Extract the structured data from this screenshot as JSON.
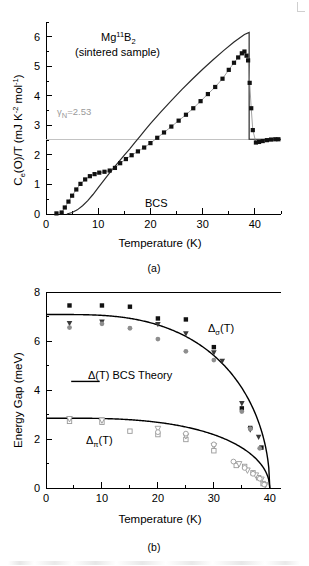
{
  "figure": {
    "panel_a_caption": "(a)",
    "panel_b_caption": "(b)"
  },
  "panel_a": {
    "sample_label_main": "Mg",
    "sample_label_sup": "11",
    "sample_label_el": "B",
    "sample_label_sub": "2",
    "sample_note": "(sintered sample)",
    "bcs_label": "BCS",
    "gamma_label_symbol": "γ",
    "gamma_label_sub": "N",
    "gamma_label_value": "=2.53",
    "ylabel_main_1": "C",
    "ylabel_sub_1": "e",
    "ylabel_main_2": "(O)/T (mJ K",
    "ylabel_sup_1": "-2",
    "ylabel_main_3": " mol",
    "ylabel_sup_2": "-1",
    "ylabel_main_4": ")",
    "xlabel": "Temperature (K)"
  },
  "panel_b": {
    "ylabel": "Energy Gap (meV)",
    "xlabel": "Temperature (K)",
    "legend_label": "Δ(T) BCS Theory",
    "sigma_label_delta": "Δ",
    "sigma_label_sub": "σ",
    "sigma_label_arg": "(T)",
    "pi_label_delta": "Δ",
    "pi_label_sub": "π",
    "pi_label_arg": "(T)"
  },
  "chart_data": [
    {
      "type": "scatter",
      "id": "panel-a",
      "title": "Mg11B2 (sintered sample)",
      "xlabel": "Temperature (K)",
      "ylabel": "Ce(O)/T (mJ K^-2 mol^-1)",
      "xlim": [
        0,
        45
      ],
      "ylim": [
        0,
        6.5
      ],
      "xticks": [
        0,
        10,
        20,
        30,
        40
      ],
      "yticks": [
        0,
        1,
        2,
        3,
        4,
        5,
        6
      ],
      "xminor_step": 5,
      "yminor_step": 0.5,
      "grid": false,
      "legend": "none",
      "annotations": [
        {
          "text": "Mg11B2",
          "x": 16.0,
          "y": 5.85
        },
        {
          "text": "(sintered sample)",
          "x": 16.0,
          "y": 5.35
        },
        {
          "text": "gamma_N=2.53",
          "x": 8.0,
          "y": 2.72
        },
        {
          "text": "BCS",
          "x": 24.0,
          "y": 0.47
        }
      ],
      "gamma_n": 2.53,
      "series": [
        {
          "name": "Ce/T measured (filled squares)",
          "marker": "filled-square",
          "x": [
            2.0,
            3.0,
            3.6,
            4.3,
            5.0,
            5.8,
            6.6,
            7.5,
            8.4,
            9.3,
            10.2,
            11.2,
            12.2,
            13.2,
            14.2,
            15.3,
            16.4,
            17.6,
            18.8,
            20.0,
            21.3,
            22.6,
            24.0,
            25.4,
            26.8,
            28.2,
            29.6,
            31.0,
            32.4,
            33.8,
            35.0,
            36.0,
            36.8,
            37.5,
            38.0,
            38.4,
            38.7,
            39.0,
            39.3,
            39.6,
            40.2,
            40.8,
            41.5,
            42.3,
            43.1,
            43.9,
            44.5
          ],
          "y": [
            0.02,
            0.05,
            0.22,
            0.42,
            0.62,
            0.83,
            1.02,
            1.17,
            1.28,
            1.35,
            1.4,
            1.43,
            1.47,
            1.56,
            1.72,
            1.86,
            1.99,
            2.12,
            2.25,
            2.4,
            2.58,
            2.76,
            2.96,
            3.16,
            3.36,
            3.58,
            3.82,
            4.06,
            4.3,
            4.58,
            4.88,
            5.12,
            5.3,
            5.44,
            5.5,
            5.36,
            5.2,
            4.44,
            3.58,
            2.84,
            2.42,
            2.44,
            2.47,
            2.5,
            2.52,
            2.53,
            2.53
          ]
        }
      ],
      "curves": [
        {
          "name": "BCS",
          "style": "solid",
          "x": [
            4.0,
            5.0,
            6.0,
            7.0,
            8.0,
            9.0,
            10.0,
            11.0,
            12.0,
            13.0,
            14.0,
            15.0,
            16.0,
            17.0,
            18.0,
            19.0,
            20.0,
            22.0,
            24.0,
            26.0,
            28.0,
            30.0,
            32.0,
            34.0,
            36.0,
            38.0,
            38.9,
            38.9,
            40.0,
            42.0,
            44.0,
            45.0
          ],
          "y": [
            0.0,
            0.05,
            0.14,
            0.28,
            0.45,
            0.66,
            0.89,
            1.12,
            1.35,
            1.57,
            1.78,
            1.99,
            2.2,
            2.42,
            2.63,
            2.85,
            3.06,
            3.46,
            3.84,
            4.21,
            4.56,
            4.9,
            5.22,
            5.53,
            5.82,
            6.08,
            6.15,
            2.53,
            2.53,
            2.53,
            2.53,
            2.53
          ]
        }
      ]
    },
    {
      "type": "scatter",
      "id": "panel-b",
      "title": "Energy gaps vs temperature",
      "xlabel": "Temperature (K)",
      "ylabel": "Energy Gap (meV)",
      "xlim": [
        0,
        42
      ],
      "ylim": [
        0,
        8
      ],
      "xticks": [
        0,
        10,
        20,
        30,
        40
      ],
      "yticks": [
        0,
        2,
        4,
        6,
        8
      ],
      "xminor_step": 5,
      "yminor_step": 1,
      "grid": false,
      "legend": "inline",
      "legend_entries": [
        "Δ(T) BCS Theory"
      ],
      "annotations": [
        {
          "text": "Delta_sigma(T)",
          "x": 29.0,
          "y": 6.55
        },
        {
          "text": "Delta_pi(T)",
          "x": 9.0,
          "y": 1.95
        },
        {
          "text": "Δ(T) BCS Theory",
          "x": 10.5,
          "y": 4.35
        }
      ],
      "series": [
        {
          "name": "sigma gap - filled squares",
          "marker": "filled-square",
          "x": [
            4.2,
            10.0,
            15.0,
            20.0,
            25.0,
            30.0,
            35.0,
            36.5,
            38.5
          ],
          "y": [
            7.45,
            7.45,
            7.4,
            6.92,
            6.88,
            5.75,
            3.25,
            2.45,
            1.65
          ]
        },
        {
          "name": "sigma gap - filled down triangles",
          "marker": "filled-triangle-down",
          "x": [
            4.2,
            10.0,
            20.0,
            25.0,
            30.0,
            31.5,
            35.0,
            36.5,
            38.0
          ],
          "y": [
            6.72,
            6.78,
            6.68,
            6.3,
            5.52,
            5.18,
            3.45,
            2.38,
            2.08
          ]
        },
        {
          "name": "sigma gap - grey circles",
          "marker": "circle-grey",
          "x": [
            4.2,
            10.0,
            15.0,
            20.0,
            25.0,
            30.0,
            35.0,
            36.5,
            38.2
          ],
          "y": [
            6.55,
            6.7,
            6.52,
            6.08,
            5.58,
            5.22,
            3.12,
            2.42,
            1.62
          ]
        },
        {
          "name": "pi gap - open squares",
          "marker": "open-square",
          "x": [
            4.2,
            10.0,
            15.0,
            20.0,
            25.0,
            30.0,
            34.0,
            35.5,
            37.0,
            38.0,
            38.8
          ],
          "y": [
            2.72,
            2.68,
            2.32,
            2.18,
            1.98,
            1.52,
            0.92,
            0.88,
            0.62,
            0.42,
            0.18
          ]
        },
        {
          "name": "pi gap - open triangles",
          "marker": "open-triangle",
          "x": [
            4.2,
            10.0,
            20.0,
            25.0,
            30.0,
            34.5,
            36.0,
            37.5,
            38.5,
            39.2
          ],
          "y": [
            2.82,
            2.76,
            2.42,
            2.12,
            1.72,
            0.98,
            0.72,
            0.52,
            0.35,
            0.12
          ]
        },
        {
          "name": "pi gap - open circles",
          "marker": "open-circle",
          "x": [
            20.0,
            25.0,
            30.0,
            33.5,
            35.5,
            37.0,
            38.2,
            39.0
          ],
          "y": [
            2.28,
            2.22,
            1.78,
            1.08,
            0.82,
            0.58,
            0.38,
            0.14
          ]
        }
      ],
      "curves": [
        {
          "name": "BCS sigma",
          "delta0": 7.08,
          "tc": 40.0,
          "style": "solid"
        },
        {
          "name": "BCS pi",
          "delta0": 2.85,
          "tc": 40.0,
          "style": "solid"
        }
      ]
    }
  ]
}
